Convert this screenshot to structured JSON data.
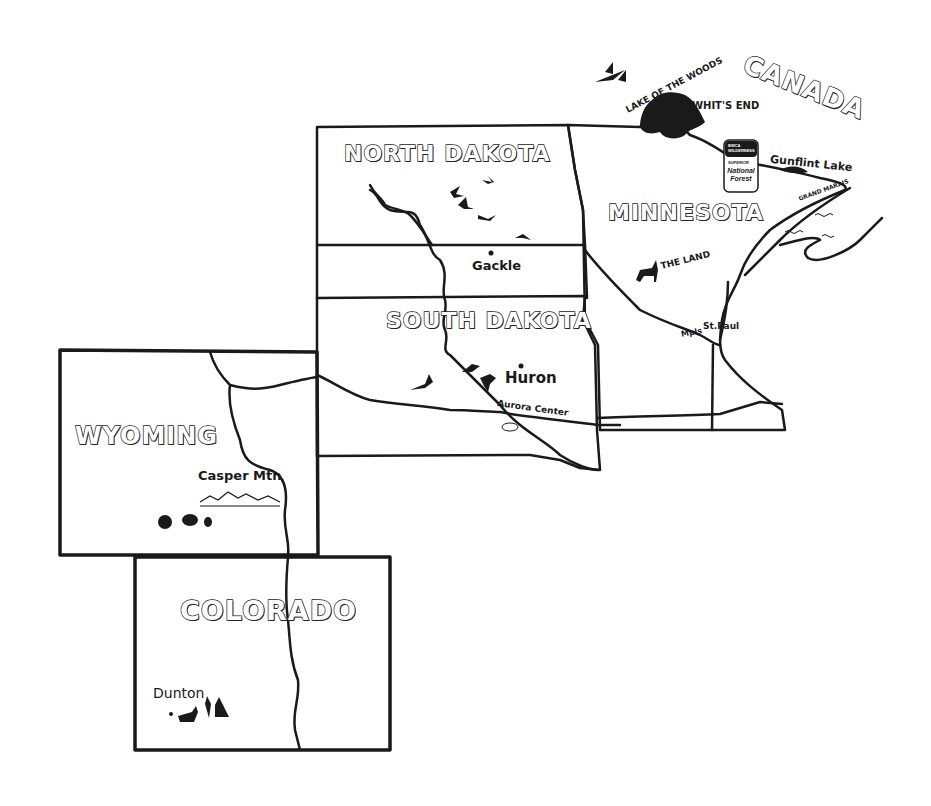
{
  "map": {
    "title": "Hand-drawn map of upper Midwest and Mountain West states",
    "states": [
      {
        "name": "NORTH DAKOTA"
      },
      {
        "name": "MINNESOTA"
      },
      {
        "name": "SOUTH DAKOTA"
      },
      {
        "name": "WYOMING"
      },
      {
        "name": "COLORADO"
      }
    ],
    "country_label": "CANADA",
    "places": {
      "lake_of_the_woods": "LAKE OF THE WOODS",
      "whits_end": "WHIT'S END",
      "gunflint_lake": "Gunflint Lake",
      "grand_marais": "GRAND MARAIS",
      "the_land": "THE LAND",
      "mpls": "Mpls",
      "st_paul": "St.Paul",
      "gackle": "Gackle",
      "huron": "Huron",
      "aurora_center": "Aurora Center",
      "casper_mtn": "Casper Mtn",
      "dunton": "Dunton"
    },
    "sign": {
      "top_line1": "BWCA",
      "top_line2": "WILDERNESS",
      "mid": "SUPERIOR",
      "bottom1": "National",
      "bottom2": "Forest"
    },
    "icons": [
      "geese-flock",
      "pheasants",
      "deer",
      "turkeys",
      "elk",
      "mountain-range",
      "lake-waves"
    ],
    "colors": {
      "ink": "#1a1a1a",
      "paper": "#ffffff"
    }
  }
}
